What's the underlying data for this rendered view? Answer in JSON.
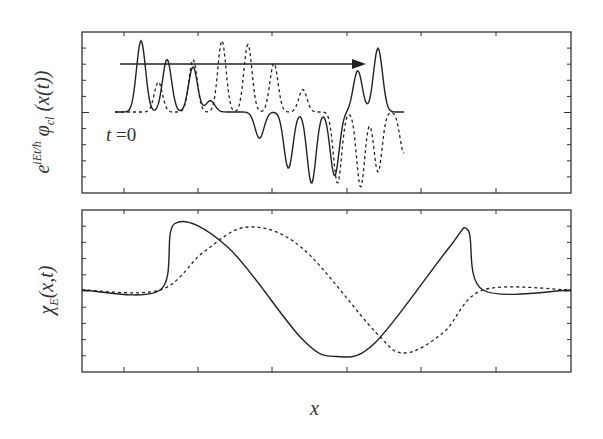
{
  "figure": {
    "top_panel": {
      "ylabel_prefix": "e",
      "ylabel_exp": "iEt/ħ",
      "ylabel_main": "φ",
      "ylabel_sub": "cl",
      "ylabel_arg": " (x(t))",
      "annotation_var": "t",
      "annotation_eq": " =0",
      "arrow": "propagation direction →"
    },
    "bottom_panel": {
      "ylabel_main": "χ",
      "ylabel_sub": "E",
      "ylabel_arg": "(x,t)"
    },
    "xlabel": "x"
  },
  "chart_data": [
    {
      "type": "line",
      "panel": "top",
      "title": "",
      "ylabel": "e^{iEt/ħ} φ_cl(x(t))",
      "xlabel": "",
      "annotations": [
        "t = 0",
        "arrow pointing right (time evolution)"
      ],
      "grid": false,
      "legend": "none",
      "series": [
        {
          "name": "solid (real part)",
          "style": "solid",
          "description": "oscillatory packet: positive peaks decaying left→right, then negative dips growing, then positive peaks rising at right edge",
          "peaks_x_frac": [
            0.09,
            0.18,
            0.27,
            0.33,
            0.5,
            0.6,
            0.68,
            0.76,
            0.84,
            0.91
          ],
          "peaks_y": [
            0.95,
            0.7,
            0.6,
            0.15,
            -0.35,
            -0.75,
            -0.95,
            -0.85,
            0.55,
            0.85
          ]
        },
        {
          "name": "dashed (imag part)",
          "style": "dashed",
          "description": "oscillatory packet: positive peaks growing then decaying, then deep negative dips at right",
          "peaks_x_frac": [
            0.15,
            0.27,
            0.37,
            0.46,
            0.55,
            0.65,
            0.77,
            0.85,
            0.91,
            1.0
          ],
          "peaks_y": [
            0.4,
            0.7,
            0.95,
            0.9,
            0.65,
            0.3,
            -0.95,
            -1.0,
            -0.8,
            -0.55
          ]
        }
      ],
      "xlim": [
        0,
        1
      ],
      "ylim": [
        -1,
        1
      ]
    },
    {
      "type": "line",
      "panel": "bottom",
      "title": "",
      "ylabel": "χ_E(x,t)",
      "xlabel": "x",
      "grid": false,
      "legend": "none",
      "series": [
        {
          "name": "solid",
          "style": "solid",
          "x": [
            0.0,
            0.16,
            0.19,
            0.3,
            0.45,
            0.52,
            0.6,
            0.75,
            0.79,
            0.82,
            1.0
          ],
          "y": [
            0.0,
            0.0,
            0.95,
            0.6,
            -0.7,
            -0.95,
            -0.75,
            0.6,
            0.85,
            0.0,
            0.0
          ]
        },
        {
          "name": "dashed",
          "style": "dashed",
          "x": [
            0.0,
            0.16,
            0.25,
            0.34,
            0.45,
            0.6,
            0.66,
            0.74,
            0.82,
            1.0
          ],
          "y": [
            0.0,
            0.0,
            0.55,
            0.9,
            0.6,
            -0.6,
            -0.9,
            -0.6,
            0.0,
            0.0
          ]
        }
      ],
      "xlim": [
        0,
        1
      ],
      "ylim": [
        -1,
        1
      ]
    }
  ]
}
